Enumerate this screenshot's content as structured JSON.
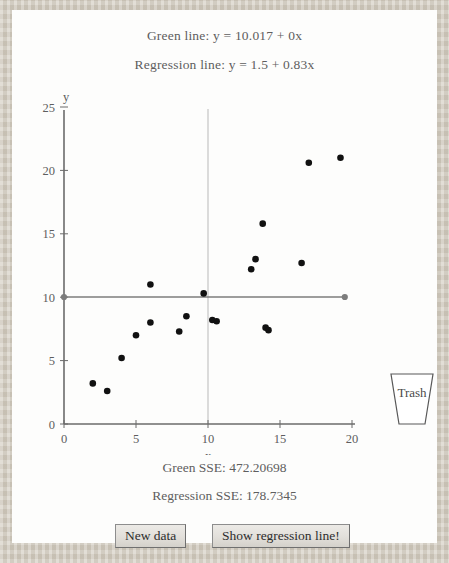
{
  "header": {
    "green_line_label": "Green line: y = 10.017 + 0x",
    "regression_line_label": "Regression line: y = 1.5 + 0.83x"
  },
  "footer": {
    "green_sse_label": "Green SSE: 472.20698",
    "regression_sse_label": "Regression SSE: 178.7345"
  },
  "controls": {
    "new_data_label": "New data",
    "show_regression_label": "Show regression line!",
    "trash_label": "Trash"
  },
  "colors": {
    "green_line": "#7c7c7c",
    "point": "#111111",
    "axis": "#6b6b6b",
    "gridline": "#b9b9b9",
    "panel_bg": "#fdfdfc",
    "page_bg": "#d2ccc0",
    "text": "#5e5e5e"
  },
  "chart_data": {
    "type": "scatter",
    "title": "",
    "xlabel": "x",
    "ylabel": "y",
    "xlim": [
      0,
      20
    ],
    "ylim": [
      0,
      25
    ],
    "xticks": [
      0,
      5,
      10,
      15,
      20
    ],
    "yticks": [
      0,
      5,
      10,
      15,
      20,
      25
    ],
    "grid": false,
    "vertical_reference_x": 10,
    "points": [
      {
        "x": 2.0,
        "y": 3.2
      },
      {
        "x": 3.0,
        "y": 2.6
      },
      {
        "x": 4.0,
        "y": 5.2
      },
      {
        "x": 5.0,
        "y": 7.0
      },
      {
        "x": 6.0,
        "y": 8.0
      },
      {
        "x": 6.0,
        "y": 11.0
      },
      {
        "x": 8.0,
        "y": 7.3
      },
      {
        "x": 8.5,
        "y": 8.5
      },
      {
        "x": 9.7,
        "y": 10.3
      },
      {
        "x": 10.3,
        "y": 8.2
      },
      {
        "x": 10.6,
        "y": 8.1
      },
      {
        "x": 13.0,
        "y": 12.2
      },
      {
        "x": 13.3,
        "y": 13.0
      },
      {
        "x": 13.8,
        "y": 15.8
      },
      {
        "x": 14.0,
        "y": 7.6
      },
      {
        "x": 14.2,
        "y": 7.4
      },
      {
        "x": 16.5,
        "y": 12.7
      },
      {
        "x": 17.0,
        "y": 20.6
      },
      {
        "x": 19.2,
        "y": 21.0
      }
    ],
    "lines": [
      {
        "name": "green-line",
        "equation": "y = 10.017 + 0x",
        "intercept": 10.017,
        "slope": 0,
        "x_start": 0,
        "x_end": 19.5,
        "color": "#7c7c7c",
        "handles": [
          {
            "x": 0,
            "y": 10.017
          },
          {
            "x": 19.5,
            "y": 10.017
          }
        ],
        "sse": 472.20698
      },
      {
        "name": "regression-line",
        "equation": "y = 1.5 + 0.83x",
        "intercept": 1.5,
        "slope": 0.83,
        "visible": false,
        "sse": 178.7345
      }
    ]
  }
}
